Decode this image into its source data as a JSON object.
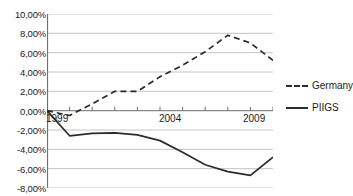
{
  "chart_data": {
    "type": "line",
    "title": "",
    "xlabel": "",
    "ylabel": "",
    "ylim": [
      -8,
      10
    ],
    "xlim": [
      1999,
      2009
    ],
    "grid": true,
    "legend_position": "right",
    "ytick_labels": [
      "10,00%",
      "8,00%",
      "6,00%",
      "4,00%",
      "2,00%",
      "0,00%",
      "-2,00%",
      "-4,00%",
      "-6,00%",
      "-8,00%"
    ],
    "ytick_values": [
      10,
      8,
      6,
      4,
      2,
      0,
      -2,
      -4,
      -6,
      -8
    ],
    "xtick_labels": [
      "1999",
      "2004",
      "2009"
    ],
    "xtick_values": [
      1999,
      2004,
      2009
    ],
    "x": [
      1999,
      2000,
      2001,
      2002,
      2003,
      2004,
      2005,
      2006,
      2007,
      2008,
      2009
    ],
    "series": [
      {
        "name": "Germany",
        "style": "dashed",
        "color": "#2b2b2b",
        "values": [
          0.0,
          -0.5,
          0.7,
          2.0,
          2.0,
          3.5,
          4.7,
          6.1,
          7.8,
          7.0,
          5.2
        ]
      },
      {
        "name": "PIIGS",
        "style": "solid",
        "color": "#2b2b2b",
        "values": [
          0.0,
          -2.6,
          -2.35,
          -2.3,
          -2.5,
          -3.1,
          -4.3,
          -5.6,
          -6.3,
          -6.7,
          -4.8
        ]
      }
    ]
  },
  "legend": {
    "items": [
      {
        "label": "Germany",
        "style": "dashed"
      },
      {
        "label": "PIIGS",
        "style": "solid"
      }
    ]
  }
}
